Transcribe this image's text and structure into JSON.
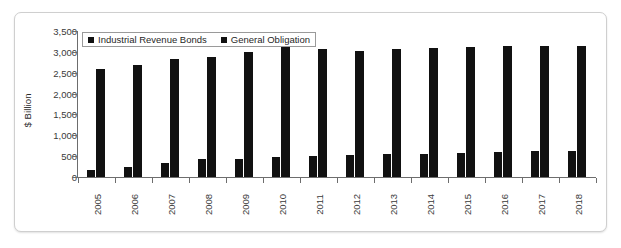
{
  "chart_data": {
    "type": "bar",
    "title": "",
    "xlabel": "",
    "ylabel": "$ Billion",
    "ylim": [
      0,
      3500
    ],
    "ytick_labels": [
      "0",
      "500",
      "1,000",
      "1,500",
      "2,000",
      "2,500",
      "3,000",
      "3,500"
    ],
    "ytick_values": [
      0,
      500,
      1000,
      1500,
      2000,
      2500,
      3000,
      3500
    ],
    "grid": false,
    "legend_position": "top-left",
    "categories": [
      "2005",
      "2006",
      "2007",
      "2008",
      "2009",
      "2010",
      "2011",
      "2012",
      "2013",
      "2014",
      "2015",
      "2016",
      "2017",
      "2018"
    ],
    "series": [
      {
        "name": "Industrial Revenue Bonds",
        "color": "#111111",
        "values": [
          180,
          250,
          340,
          420,
          440,
          470,
          500,
          530,
          540,
          560,
          580,
          600,
          620,
          630
        ]
      },
      {
        "name": "General Obligation",
        "color": "#111111",
        "values": [
          2590,
          2690,
          2830,
          2880,
          2990,
          3110,
          3060,
          3020,
          3060,
          3090,
          3110,
          3130,
          3130,
          3140
        ]
      }
    ]
  },
  "legend": {
    "entries": [
      {
        "label": "Industrial Revenue Bonds",
        "swatch": "legend-swatch-square"
      },
      {
        "label": "General Obligation",
        "swatch": "legend-swatch-square"
      }
    ]
  }
}
